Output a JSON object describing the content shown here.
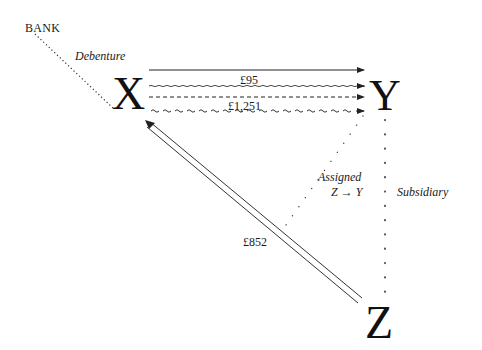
{
  "diagram": {
    "nodes": {
      "bank": "BANK",
      "x": "X",
      "y": "Y",
      "z": "Z"
    },
    "labels": {
      "debenture": "Debenture",
      "amount_95": "£95",
      "amount_1251": "£1,251",
      "amount_852": "£852",
      "assigned": "Assigned",
      "assigned_direction": "Z → Y",
      "subsidiary": "Subsidiary"
    },
    "edges": [
      {
        "from": "BANK",
        "to": "X",
        "style": "dotted",
        "label": "Debenture"
      },
      {
        "from": "X",
        "to": "Y",
        "style": "solid-arrow",
        "label": ""
      },
      {
        "from": "X",
        "to": "Y",
        "style": "wavy-arrow",
        "label": "£95"
      },
      {
        "from": "X",
        "to": "Y",
        "style": "dashed-arrow",
        "label": ""
      },
      {
        "from": "X",
        "to": "Y",
        "style": "wavy-dashed-arrow",
        "label": "£1,251"
      },
      {
        "from": "Z",
        "to": "X",
        "style": "double-arrow",
        "label": "£852"
      },
      {
        "from": "Y",
        "to": "Z",
        "style": "dotted-asterisk",
        "label": "Subsidiary"
      },
      {
        "from": "Y",
        "to": "£852 edge",
        "style": "dotted",
        "label": "Assigned Z → Y"
      }
    ],
    "colors": {
      "ink": "#1a1a1a",
      "background": "#ffffff"
    }
  }
}
